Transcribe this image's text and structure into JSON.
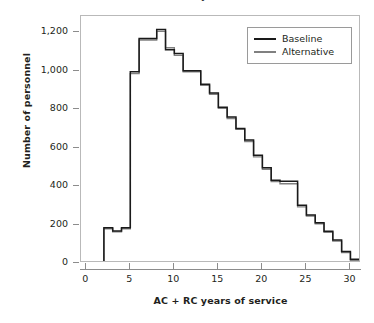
{
  "chart_data": {
    "type": "line",
    "subtype": "step-histogram",
    "title": "Number of Personnel, by Years of Service",
    "xlabel": "AC + RC years of service",
    "ylabel": "Number of personnel",
    "xlim": [
      -0.6,
      31.2
    ],
    "ylim": [
      0,
      1285
    ],
    "xticks": [
      0,
      5,
      10,
      15,
      20,
      25,
      30
    ],
    "xtick_labels": [
      "0",
      "5",
      "10",
      "15",
      "20",
      "25",
      "30"
    ],
    "yticks": [
      0,
      200,
      400,
      600,
      800,
      1000,
      1200
    ],
    "ytick_labels": [
      "0",
      "200",
      "400",
      "600",
      "800",
      "1,000",
      "1,200"
    ],
    "grid": false,
    "legend_position": "top-right",
    "x": [
      0,
      1,
      2,
      3,
      4,
      5,
      6,
      7,
      8,
      9,
      10,
      11,
      12,
      13,
      14,
      15,
      16,
      17,
      18,
      19,
      20,
      21,
      22,
      23,
      24,
      25,
      26,
      27,
      28,
      29,
      30
    ],
    "series": [
      {
        "name": "Baseline",
        "color": "#1a1a1a",
        "values": [
          0,
          0,
          183,
          166,
          183,
          995,
          1168,
          1168,
          1215,
          1110,
          1090,
          1000,
          1000,
          930,
          885,
          810,
          760,
          700,
          640,
          560,
          495,
          430,
          425,
          425,
          300,
          250,
          210,
          165,
          120,
          60,
          20
        ]
      },
      {
        "name": "Alternative",
        "color": "#808080",
        "values": [
          0,
          0,
          178,
          162,
          178,
          985,
          1160,
          1160,
          1205,
          1120,
          1080,
          995,
          995,
          925,
          878,
          805,
          752,
          695,
          632,
          552,
          488,
          424,
          412,
          412,
          292,
          244,
          204,
          160,
          114,
          54,
          14
        ]
      }
    ]
  },
  "legend": {
    "items": [
      {
        "label": "Baseline"
      },
      {
        "label": "Alternative"
      }
    ]
  },
  "colors": {
    "baseline": "#1a1a1a",
    "alternative": "#808080",
    "frame": "#b9b9b9",
    "axis": "#8c8c8c",
    "text": "#231f20",
    "background": "#ffffff"
  }
}
